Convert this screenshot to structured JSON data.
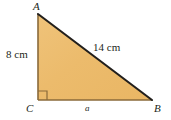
{
  "figure": {
    "kind": "right-triangle-diagram",
    "shape_fill_color": "#ecbb6c",
    "shape_fill_color_light": "#f0c67f",
    "hypotenuse_stroke_color": "#221f1c",
    "leg_stroke_color": "#8a6a3a",
    "right_angle_mark_color": "#8a6a3a",
    "background_color": "#ffffff",
    "text_color": "#231f20"
  },
  "vertices": {
    "a_label": "A",
    "b_label": "B",
    "c_label": "C"
  },
  "sides": {
    "vertical_leg_label": "8 cm",
    "hypotenuse_label": "14 cm",
    "horizontal_leg_label": "a"
  },
  "geometry": {
    "apex_x": 38,
    "apex_y": 14,
    "right_angle_x": 38,
    "right_angle_y": 100,
    "far_x": 152,
    "far_y": 100,
    "right_angle_mark_size": 9
  }
}
